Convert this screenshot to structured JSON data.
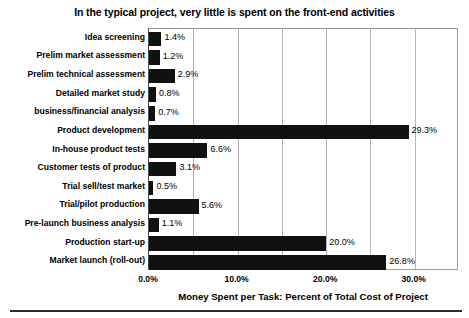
{
  "chart_data": {
    "type": "bar",
    "orientation": "horizontal",
    "title": "In the typical project, very little is spent on the front-end activities",
    "xlabel": "Money Spent per Task: Percent of Total Cost of Project",
    "ylabel": "",
    "xlim": [
      0,
      35
    ],
    "xticks": [
      "0.0%",
      "10.0%",
      "20.0%",
      "30.0%"
    ],
    "xtick_values": [
      0,
      10,
      20,
      30
    ],
    "gridlines": [
      5,
      10,
      15,
      20,
      25,
      30
    ],
    "grid": true,
    "legend": null,
    "bar_color": "#111111",
    "categories": [
      "Idea screening",
      "Prelim market assessment",
      "Prelim technical assessment",
      "Detailed market study",
      "business/financial analysis",
      "Product development",
      "In-house product tests",
      "Customer tests of product",
      "Trial sell/test market",
      "Trial/pilot production",
      "Pre-launch business analysis",
      "Production start-up",
      "Market launch (roll-out)"
    ],
    "values": [
      1.4,
      1.2,
      2.9,
      0.8,
      0.7,
      29.3,
      6.6,
      3.1,
      0.5,
      5.6,
      1.1,
      20.0,
      26.8
    ],
    "data_labels": [
      "1.4%",
      "1.2%",
      "2.9%",
      "0.8%",
      "0.7%",
      "29.3%",
      "6.6%",
      "3.1%",
      "0.5%",
      "5.6%",
      "1.1%",
      "20.0%",
      "26.8%"
    ]
  }
}
